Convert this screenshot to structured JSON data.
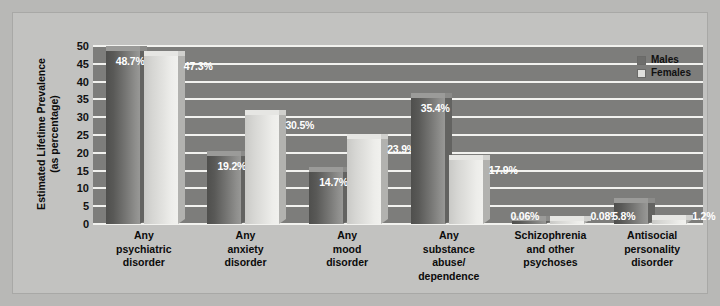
{
  "chart_data": {
    "type": "bar",
    "title": "",
    "xlabel": "",
    "ylabel": "Estimated Lifetime Prevalence (as percentage)",
    "ylabel_line1": "Estimated Lifetime Prevalence",
    "ylabel_line2": "(as percentage)",
    "ylim": [
      0,
      50
    ],
    "ytick_step": 5,
    "yticks": [
      "50",
      "45",
      "40",
      "35",
      "30",
      "25",
      "20",
      "15",
      "10",
      "5",
      "0"
    ],
    "ytick_values": [
      50,
      45,
      40,
      35,
      30,
      25,
      20,
      15,
      10,
      5,
      0
    ],
    "grid": true,
    "grid_axis": "y",
    "legend_position": "top-right",
    "categories": [
      "Any\npsychiatric\ndisorder",
      "Any\nanxiety\ndisorder",
      "Any\nmood\ndisorder",
      "Any\nsubstance\nabuse/\ndependence",
      "Schizophrenia\nand other\npsychoses",
      "Antisocial\npersonality\ndisorder"
    ],
    "series": [
      {
        "name": "Males",
        "color": "#6e6e6c",
        "values": [
          48.7,
          19.2,
          14.7,
          35.4,
          0.06,
          5.8
        ],
        "labels": [
          "48.7%",
          "19.2%",
          "14.7%",
          "35.4%",
          "0.06%",
          "5.8%"
        ]
      },
      {
        "name": "Females",
        "color": "#e0e0dd",
        "values": [
          47.3,
          30.5,
          23.9,
          17.9,
          0.08,
          1.2
        ],
        "labels": [
          "47.3%",
          "30.5%",
          "23.9%",
          "17.9%",
          "0.08%",
          "1.2%"
        ]
      }
    ]
  },
  "legend": {
    "items": [
      {
        "label": "Males",
        "color": "#6e6e6c"
      },
      {
        "label": "Females",
        "color": "#e0e0dd"
      }
    ]
  }
}
